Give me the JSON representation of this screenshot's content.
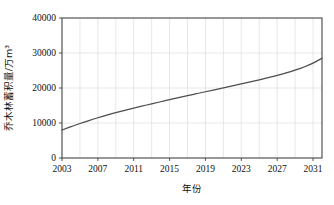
{
  "chart_data": {
    "type": "line",
    "title": "",
    "xlabel": "年份",
    "ylabel": "乔木林蓄积量/万m³",
    "xlim": [
      2003,
      2032
    ],
    "ylim": [
      0,
      40000
    ],
    "grid": true,
    "legend": "none",
    "x_tick_labels": [
      "2003",
      "2007",
      "2011",
      "2015",
      "2019",
      "2023",
      "2027",
      "2031"
    ],
    "x_ticks": [
      2003,
      2007,
      2011,
      2015,
      2019,
      2023,
      2027,
      2031
    ],
    "y_tick_labels": [
      "0",
      "10000",
      "20000",
      "30000",
      "40000"
    ],
    "y_ticks": [
      0,
      10000,
      20000,
      30000,
      40000
    ],
    "minor_x_gridlines": [
      2005,
      2009,
      2013,
      2017,
      2021,
      2025,
      2029
    ],
    "series": [
      {
        "name": "乔木林蓄积量",
        "color": "#4d4d4d",
        "x": [
          2003,
          2004,
          2005,
          2006,
          2007,
          2008,
          2009,
          2010,
          2011,
          2012,
          2013,
          2014,
          2015,
          2016,
          2017,
          2018,
          2019,
          2020,
          2021,
          2022,
          2023,
          2024,
          2025,
          2026,
          2027,
          2028,
          2029,
          2030,
          2031,
          2032
        ],
        "values": [
          8000,
          8950,
          9850,
          10700,
          11500,
          12250,
          12950,
          13620,
          14250,
          14870,
          15480,
          16070,
          16650,
          17230,
          17800,
          18370,
          18930,
          19490,
          20050,
          20610,
          21180,
          21760,
          22350,
          22960,
          23600,
          24300,
          25100,
          26000,
          27100,
          28500
        ]
      }
    ]
  },
  "axes": {
    "y_axis_name": "y-axis",
    "x_axis_name": "x-axis"
  }
}
